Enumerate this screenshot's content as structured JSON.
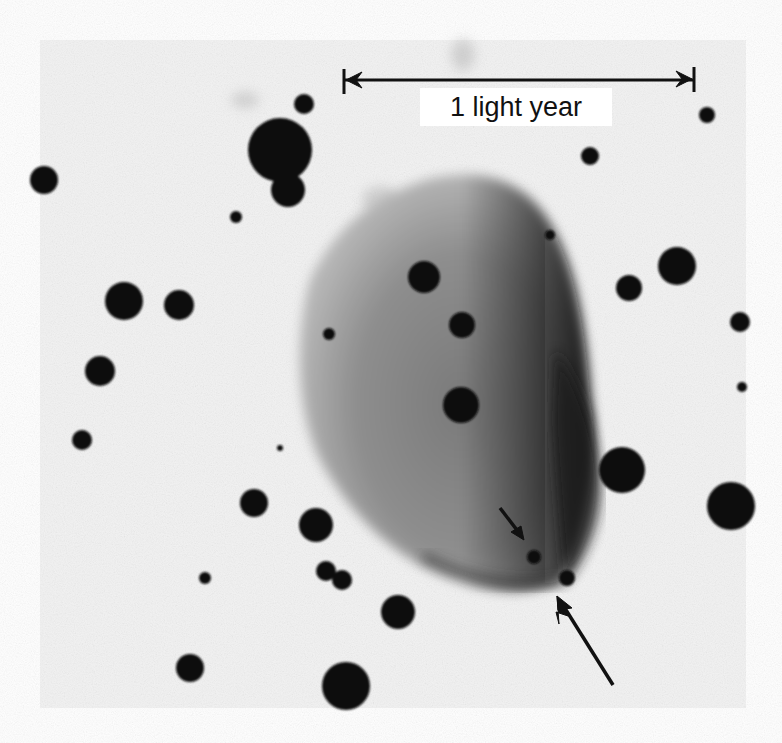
{
  "figure": {
    "type": "astronomical-photograph-negative",
    "plate": {
      "x": 40,
      "y": 40,
      "width": 706,
      "height": 668,
      "background": "#f3f3f3"
    },
    "scale_bar": {
      "label": "1 light year",
      "x1": 344,
      "x2": 694,
      "y": 80,
      "color": "#111111"
    },
    "nebula": {
      "color": "#5a5a5a",
      "dark_edge_color": "#1c1c1c"
    },
    "pointer_arrows": [
      {
        "name": "short-arrow",
        "x1": 500,
        "y1": 508,
        "x2": 522,
        "y2": 538
      },
      {
        "name": "long-arrow",
        "x1": 613,
        "y1": 685,
        "x2": 558,
        "y2": 598
      }
    ],
    "stars": [
      {
        "cx": 280,
        "cy": 150,
        "r": 32
      },
      {
        "cx": 288,
        "cy": 190,
        "r": 17
      },
      {
        "cx": 304,
        "cy": 104,
        "r": 10
      },
      {
        "cx": 44,
        "cy": 180,
        "r": 14
      },
      {
        "cx": 236,
        "cy": 217,
        "r": 6
      },
      {
        "cx": 124,
        "cy": 301,
        "r": 19
      },
      {
        "cx": 179,
        "cy": 305,
        "r": 15
      },
      {
        "cx": 100,
        "cy": 371,
        "r": 15
      },
      {
        "cx": 82,
        "cy": 440,
        "r": 10
      },
      {
        "cx": 329,
        "cy": 334,
        "r": 6
      },
      {
        "cx": 424,
        "cy": 277,
        "r": 16
      },
      {
        "cx": 462,
        "cy": 325,
        "r": 13
      },
      {
        "cx": 461,
        "cy": 405,
        "r": 18
      },
      {
        "cx": 677,
        "cy": 266,
        "r": 19
      },
      {
        "cx": 629,
        "cy": 288,
        "r": 13
      },
      {
        "cx": 590,
        "cy": 156,
        "r": 9
      },
      {
        "cx": 707,
        "cy": 115,
        "r": 8
      },
      {
        "cx": 740,
        "cy": 322,
        "r": 10
      },
      {
        "cx": 742,
        "cy": 387,
        "r": 5
      },
      {
        "cx": 622,
        "cy": 470,
        "r": 23
      },
      {
        "cx": 731,
        "cy": 506,
        "r": 24
      },
      {
        "cx": 254,
        "cy": 503,
        "r": 14
      },
      {
        "cx": 316,
        "cy": 525,
        "r": 17
      },
      {
        "cx": 326,
        "cy": 571,
        "r": 10
      },
      {
        "cx": 342,
        "cy": 580,
        "r": 10
      },
      {
        "cx": 398,
        "cy": 612,
        "r": 17
      },
      {
        "cx": 205,
        "cy": 578,
        "r": 6
      },
      {
        "cx": 190,
        "cy": 668,
        "r": 14
      },
      {
        "cx": 346,
        "cy": 686,
        "r": 24
      },
      {
        "cx": 534,
        "cy": 557,
        "r": 7
      },
      {
        "cx": 567,
        "cy": 578,
        "r": 8
      },
      {
        "cx": 550,
        "cy": 235,
        "r": 5
      },
      {
        "cx": 280,
        "cy": 448,
        "r": 3
      }
    ]
  }
}
